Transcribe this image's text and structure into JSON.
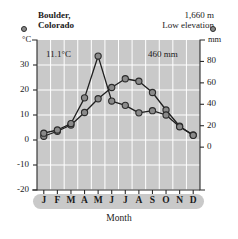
{
  "station": {
    "name_line1": "Boulder,",
    "name_line2": "Colorado"
  },
  "elevation": {
    "value": "1,660 m",
    "category": "Low elevation"
  },
  "annotations": {
    "avg_temp": "11.1°C",
    "total_precip": "460 mm"
  },
  "units": {
    "left": "°C",
    "right": "mm"
  },
  "axis_title": "Month",
  "legend": {
    "temperature_marker": "temperature-dot",
    "precipitation_marker": "precipitation-dot"
  },
  "colors": {
    "plot_background": "#c9c9c9",
    "gridline": "#ffffff",
    "marker_fill": "#8a8a8a",
    "marker_stroke": "#2b2b2b",
    "line": "#1f1f1f",
    "month_band": "#c9c9c9"
  },
  "chart_data": {
    "type": "line",
    "title": "Boulder, Colorado",
    "xlabel": "Month",
    "categories": [
      "J",
      "F",
      "M",
      "A",
      "M",
      "J",
      "J",
      "A",
      "S",
      "O",
      "N",
      "D"
    ],
    "month_names": [
      "January",
      "February",
      "March",
      "April",
      "May",
      "June",
      "July",
      "August",
      "September",
      "October",
      "November",
      "December"
    ],
    "grid": true,
    "legend_position": "top-corners",
    "axes": {
      "left": {
        "label": "°C",
        "ticks": [
          30,
          20,
          10,
          0,
          -10,
          -20
        ],
        "ylim": [
          -20,
          40
        ]
      },
      "right": {
        "label": "mm",
        "ticks": [
          80,
          60,
          40,
          20,
          0
        ],
        "ylim": [
          -40,
          100
        ]
      }
    },
    "series": [
      {
        "name": "Temperature",
        "unit": "°C",
        "axis": "left",
        "values": [
          1.5,
          3.5,
          6.0,
          11.0,
          16.5,
          21.0,
          24.5,
          23.5,
          19.0,
          12.0,
          5.5,
          2.0
        ]
      },
      {
        "name": "Precipitation",
        "unit": "mm",
        "axis": "right",
        "values": [
          13,
          16,
          22,
          46,
          85,
          43,
          39,
          32,
          34,
          30,
          19,
          11
        ]
      }
    ],
    "summary": {
      "mean_annual_temperature": "11.1°C",
      "total_annual_precipitation": "460 mm",
      "elevation": "1,660 m",
      "elevation_category": "Low elevation"
    }
  }
}
